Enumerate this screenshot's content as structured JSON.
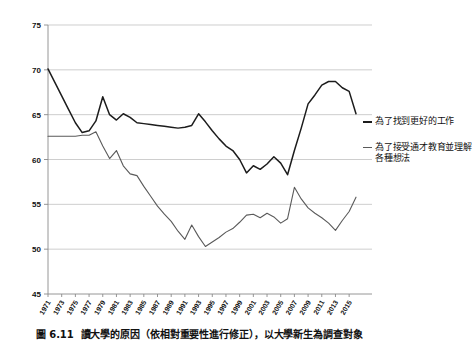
{
  "caption": {
    "number": "圖 6.11",
    "text": "讀大學的原因（依相對重要性進行修正），以大學新生為調查對象"
  },
  "legend": {
    "entries": [
      {
        "label": "為了找到更好的工作",
        "color": "#1c1c1c",
        "icon": "line-swatch-icon"
      },
      {
        "label": "為了接受通才教育並理解各種想法",
        "color": "#5a5a5a",
        "icon": "line-swatch-icon"
      }
    ]
  },
  "chart_data": {
    "type": "line",
    "title": "讀大學的原因（依相對重要性進行修正），以大學新生為調查對象",
    "xlabel": "",
    "ylabel": "",
    "ylim": [
      45,
      75
    ],
    "yticks": [
      45,
      50,
      55,
      60,
      65,
      70,
      75
    ],
    "grid": true,
    "legend_position": "right",
    "x": [
      1971,
      1972,
      1973,
      1974,
      1975,
      1976,
      1977,
      1978,
      1979,
      1980,
      1981,
      1982,
      1983,
      1984,
      1985,
      1986,
      1987,
      1988,
      1989,
      1990,
      1991,
      1992,
      1993,
      1994,
      1995,
      1996,
      1997,
      1998,
      1999,
      2000,
      2001,
      2002,
      2003,
      2004,
      2005,
      2006,
      2007,
      2008,
      2009,
      2010,
      2011,
      2012,
      2013,
      2014,
      2015,
      2016
    ],
    "xtick_labels": [
      "1971",
      "1973",
      "1975",
      "1977",
      "1979",
      "1981",
      "1983",
      "1985",
      "1987",
      "1989",
      "1991",
      "1993",
      "1995",
      "1997",
      "1999",
      "2001",
      "2003",
      "2005",
      "2007",
      "2009",
      "2011",
      "2013",
      "2015"
    ],
    "series": [
      {
        "name": "為了找到更好的工作",
        "color": "#1c1c1c",
        "values": [
          70.1,
          68.6,
          67.1,
          65.6,
          64.1,
          63.0,
          63.2,
          64.3,
          67.0,
          65.0,
          64.4,
          65.1,
          64.7,
          64.1,
          64.0,
          63.9,
          63.8,
          63.7,
          63.6,
          63.5,
          63.6,
          63.8,
          65.1,
          64.2,
          63.2,
          62.3,
          61.5,
          61.0,
          60.0,
          58.5,
          59.3,
          58.9,
          59.5,
          60.3,
          59.6,
          58.3,
          61.0,
          63.5,
          66.2,
          67.2,
          68.3,
          68.7,
          68.7,
          68.0,
          67.6,
          65.1
        ]
      },
      {
        "name": "為了接受通才教育並理解各種想法",
        "color": "#5a5a5a",
        "values": [
          62.6,
          62.6,
          62.6,
          62.6,
          62.6,
          62.7,
          62.7,
          63.1,
          61.5,
          60.1,
          61.0,
          59.3,
          58.4,
          58.2,
          57.0,
          55.9,
          54.8,
          53.9,
          53.1,
          52.0,
          51.1,
          52.7,
          51.4,
          50.3,
          50.8,
          51.3,
          51.9,
          52.3,
          53.0,
          53.8,
          53.9,
          53.5,
          54.0,
          53.6,
          52.9,
          53.4,
          56.9,
          55.6,
          54.6,
          54.0,
          53.5,
          52.9,
          52.1,
          53.2,
          54.2,
          55.8
        ]
      }
    ]
  }
}
